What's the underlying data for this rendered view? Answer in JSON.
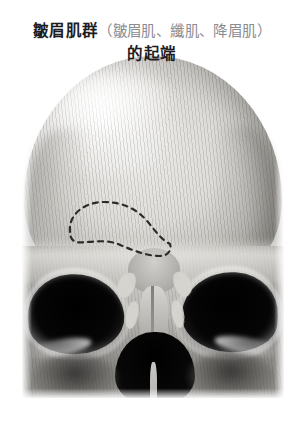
{
  "figure": {
    "caption": {
      "line1_strong": "皺眉肌群",
      "line1_paren": "（皺眉肌、纖肌、降眉肌）",
      "line2": "的起端",
      "strong_color": "#1d1d1f",
      "paren_color": "#8b8b90"
    },
    "photo": {
      "subject": "human-skull-frontal-view",
      "rendering": "grayscale halftone photograph",
      "background_color": "#ffffff"
    },
    "annotation": {
      "type": "dashed-outline-region",
      "label": "corrugator-supercilii-origin-area",
      "side": "left-supraorbital-ridge",
      "stroke_color": "#2b2b2b",
      "dash_pattern": "5 5",
      "stroke_width": 2.2
    },
    "markings": [
      {
        "name": "mark-left-upper",
        "color": "#d7d5cf"
      },
      {
        "name": "mark-right-upper",
        "color": "#d7d5cf"
      },
      {
        "name": "mark-left-lower",
        "color": "#d7d5cf"
      },
      {
        "name": "mark-right-lower",
        "color": "#d7d5cf"
      }
    ]
  }
}
